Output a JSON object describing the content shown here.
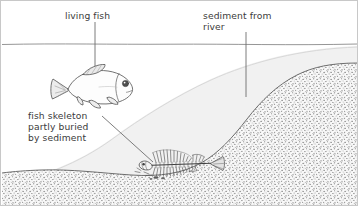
{
  "figure": {
    "domain": "diagram",
    "width": 358,
    "height": 206,
    "background": "#ffffff",
    "border_color": "#c8c8c8"
  },
  "labels": {
    "living_fish": "living fish",
    "sediment_from_river": "sediment from\nriver",
    "fish_skeleton": "fish skeleton\npartly buried\nby sediment"
  },
  "colors": {
    "text": "#3b3b3b",
    "outline": "#555555",
    "leader_line": "#6e6e6e",
    "water_line": "#7d7d7d",
    "water_fill": "#ffffff",
    "new_sediment_fill": "#f0f0f0",
    "new_sediment_edge": "#c0c0c0",
    "bedrock_stipple": "#6b6b6b",
    "bedrock_fill": "#fbfbfb",
    "fish_body_fill": "#fdfdfd",
    "fish_fin_fill": "#efefef",
    "skeleton": "#4a4a4a"
  },
  "elements": {
    "water_surface": {
      "name": "water-surface-line",
      "y": 43
    },
    "living_fish": {
      "name": "living-fish",
      "cx": 92,
      "cy": 88
    },
    "fish_skeleton": {
      "name": "fish-skeleton",
      "cx": 172,
      "cy": 160
    },
    "new_sediment": {
      "name": "new-sediment-deposit"
    },
    "bedrock": {
      "name": "bedrock-stippled-layer"
    }
  },
  "leaders": [
    {
      "name": "leader-living-fish",
      "x1": 94,
      "y1": 21,
      "x2": 94,
      "y2": 88
    },
    {
      "name": "leader-sediment-from-river",
      "x1": 245,
      "y1": 31,
      "x2": 245,
      "y2": 96
    },
    {
      "name": "leader-fish-skeleton",
      "x1": 101,
      "y1": 115,
      "x2": 152,
      "y2": 161
    }
  ]
}
